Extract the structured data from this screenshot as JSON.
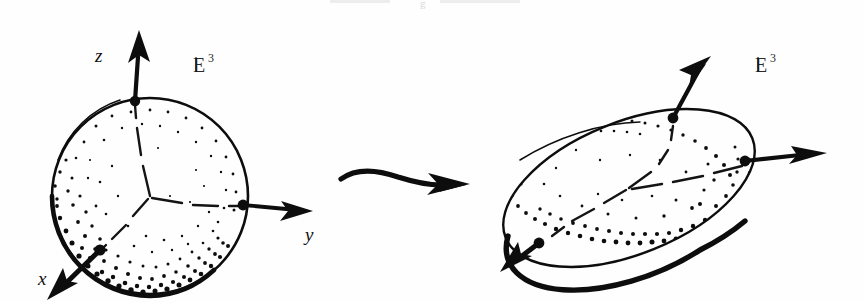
{
  "figure": {
    "background_color": "#fefefe",
    "ink_color": "#0d0d0d",
    "width": 865,
    "height": 302,
    "ghost_caption": "g"
  },
  "left_panel": {
    "name": "sphere-panel",
    "shape": "sphere",
    "space_label": "E",
    "space_exponent": "3",
    "axes": [
      {
        "id": "z",
        "label": "z",
        "direction": "up",
        "label_x": 95,
        "label_y": 62,
        "node_x": 135,
        "node_y": 101,
        "tip_x": 139,
        "tip_y": 34
      },
      {
        "id": "y",
        "label": "y",
        "direction": "right",
        "label_x": 307,
        "label_y": 240,
        "node_x": 243,
        "node_y": 205,
        "tip_x": 313,
        "tip_y": 211
      },
      {
        "id": "x",
        "label": "x",
        "direction": "down-left",
        "label_x": 40,
        "label_y": 285,
        "node_x": 100,
        "node_y": 250,
        "tip_x": 47,
        "tip_y": 297
      }
    ],
    "geometry": {
      "center_x": 150,
      "center_y": 196,
      "radius_x": 98,
      "radius_y": 100,
      "rotation": 0
    },
    "space_label_x": 195,
    "space_label_y": 68
  },
  "transform_arrow": {
    "name": "deformation-arrow",
    "style": "hand-drawn-curved",
    "start_x": 340,
    "start_y": 176,
    "end_x": 466,
    "end_y": 184
  },
  "right_panel": {
    "name": "ellipsoid-panel",
    "shape": "ellipsoid",
    "space_label": "E",
    "space_exponent": "3",
    "axes": [
      {
        "id": "z",
        "label": "",
        "direction": "up-right",
        "node_x": 672,
        "node_y": 117,
        "tip_x": 709,
        "tip_y": 56
      },
      {
        "id": "y",
        "label": "",
        "direction": "right",
        "node_x": 745,
        "node_y": 160,
        "tip_x": 827,
        "tip_y": 153
      },
      {
        "id": "x",
        "label": "",
        "direction": "down-left",
        "node_x": 570,
        "node_y": 243,
        "tip_x": 504,
        "tip_y": 270
      }
    ],
    "geometry": {
      "center_x": 629,
      "center_y": 188,
      "radius_x": 133,
      "radius_y": 66,
      "rotation": -22
    },
    "space_label_x": 757,
    "space_label_y": 68
  },
  "stipple": {
    "description": "hand-stippled shading dots, denser along lower-left limb",
    "dot_color": "#0d0d0d"
  }
}
